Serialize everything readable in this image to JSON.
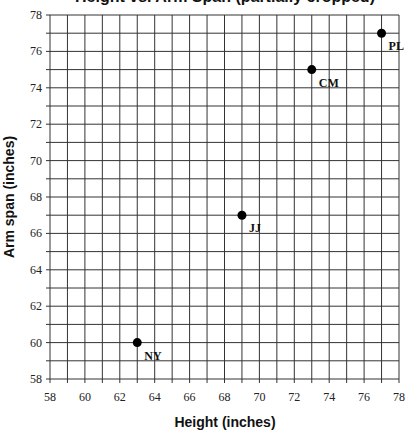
{
  "chart_data": {
    "type": "scatter",
    "title": "Height vs. Arm Span (partially cropped)",
    "xlabel": "Height (inches)",
    "ylabel": "Arm span (inches)",
    "xlim": [
      58,
      78
    ],
    "ylim": [
      58,
      78
    ],
    "x_ticks": [
      58,
      60,
      62,
      64,
      66,
      68,
      70,
      72,
      74,
      76,
      78
    ],
    "y_ticks": [
      58,
      60,
      62,
      64,
      66,
      68,
      70,
      72,
      74,
      76,
      78
    ],
    "grid": true,
    "grid_step": 1,
    "legend": "none",
    "points": [
      {
        "label": "PL",
        "x": 77,
        "y": 77
      },
      {
        "label": "CM",
        "x": 73,
        "y": 75
      },
      {
        "label": "JJ",
        "x": 69,
        "y": 67
      },
      {
        "label": "NY",
        "x": 63,
        "y": 60
      }
    ]
  },
  "colors": {
    "grid": "#333333",
    "point": "#000000",
    "background": "#ffffff"
  },
  "plot_box": {
    "left": 50,
    "top": 15,
    "right": 399,
    "bottom": 379
  }
}
